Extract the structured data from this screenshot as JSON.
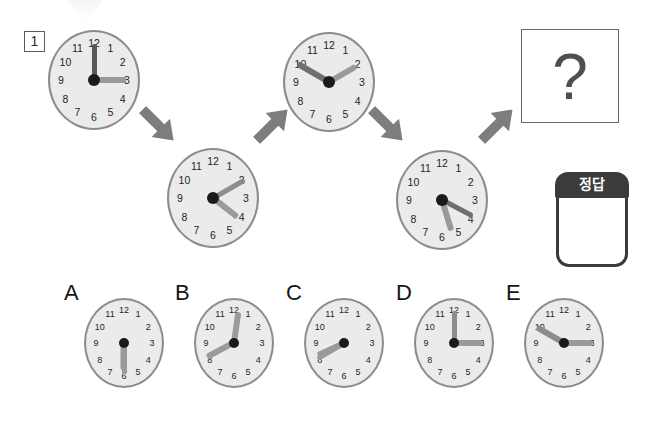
{
  "page": {
    "problem_number": "1",
    "question_mark": "?",
    "background_color": "#ffffff"
  },
  "colors": {
    "face": "#ebebeb",
    "rim": "#8c8c8c",
    "numeral": "#1f1f1f",
    "hand_dark": "#595959",
    "hand_light": "#9a9a9a",
    "pin": "#1a1a1a",
    "arrow": "#7d7d7d",
    "answer_cap": "#3b3b3b",
    "question_border": "#6a6a6a"
  },
  "clock_numerals": [
    "12",
    "1",
    "2",
    "3",
    "4",
    "5",
    "6",
    "7",
    "8",
    "9",
    "10",
    "11"
  ],
  "sequence": {
    "label": "clock-sequence",
    "clocks": [
      {
        "name": "sequence-clock-1",
        "time_label": "3:00",
        "x": 48,
        "y": 30,
        "hands": [
          {
            "role": "minute",
            "angle": 0,
            "length": 36,
            "width": 5,
            "color": "#595959"
          },
          {
            "role": "hour",
            "angle": 90,
            "length": 32,
            "width": 6,
            "color": "#9a9a9a"
          }
        ]
      },
      {
        "name": "sequence-clock-2",
        "time_label": "4:10",
        "x": 167,
        "y": 148,
        "hands": [
          {
            "role": "minute",
            "angle": 60,
            "length": 36,
            "width": 5,
            "color": "#8d8d8d"
          },
          {
            "role": "hour",
            "angle": 128,
            "length": 31,
            "width": 6,
            "color": "#9a9a9a"
          }
        ]
      },
      {
        "name": "sequence-clock-3",
        "time_label": "2:50",
        "x": 283,
        "y": 32,
        "hands": [
          {
            "role": "minute",
            "angle": 300,
            "length": 36,
            "width": 5.5,
            "color": "#6f6f6f"
          },
          {
            "role": "hour",
            "angle": 60,
            "length": 31,
            "width": 6,
            "color": "#9a9a9a"
          }
        ]
      },
      {
        "name": "sequence-clock-4",
        "time_label": "5:20",
        "x": 396,
        "y": 150,
        "hands": [
          {
            "role": "minute",
            "angle": 118,
            "length": 34,
            "width": 5,
            "color": "#6f6f6f"
          },
          {
            "role": "hour",
            "angle": 163,
            "length": 32,
            "width": 6,
            "color": "#9a9a9a"
          }
        ]
      }
    ]
  },
  "arrows": [
    {
      "name": "arrow-down-right-1",
      "x": 136,
      "y": 112,
      "rotation": 45
    },
    {
      "name": "arrow-up-right-1",
      "x": 250,
      "y": 112,
      "rotation": -45
    },
    {
      "name": "arrow-down-right-2",
      "x": 365,
      "y": 112,
      "rotation": 45
    },
    {
      "name": "arrow-up-right-2",
      "x": 475,
      "y": 112,
      "rotation": -45
    }
  ],
  "answer_box": {
    "label": "정답"
  },
  "options": [
    {
      "letter": "A",
      "name": "option-clock-a",
      "letter_x": 64,
      "letter_y": 282,
      "x": 84,
      "y": 298,
      "time_label": "6:30",
      "hands": [
        {
          "role": "minute",
          "angle": 180,
          "length": 31,
          "width": 5,
          "color": "#9a9a9a"
        },
        {
          "role": "hour",
          "angle": 180,
          "length": 27,
          "width": 5.5,
          "color": "#9a9a9a"
        }
      ]
    },
    {
      "letter": "B",
      "name": "option-clock-b",
      "letter_x": 175,
      "letter_y": 282,
      "x": 194,
      "y": 298,
      "time_label": "8:00",
      "hands": [
        {
          "role": "minute",
          "angle": 8,
          "length": 31,
          "width": 5.5,
          "color": "#9a9a9a"
        },
        {
          "role": "hour",
          "angle": 242,
          "length": 30,
          "width": 5.5,
          "color": "#9a9a9a"
        }
      ]
    },
    {
      "letter": "C",
      "name": "option-clock-c",
      "letter_x": 286,
      "letter_y": 282,
      "x": 304,
      "y": 298,
      "time_label": "8:40",
      "hands": [
        {
          "role": "minute",
          "angle": 240,
          "length": 31,
          "width": 5,
          "color": "#9a9a9a"
        },
        {
          "role": "hour",
          "angle": 245,
          "length": 29,
          "width": 6,
          "color": "#9a9a9a"
        }
      ]
    },
    {
      "letter": "D",
      "name": "option-clock-d",
      "letter_x": 396,
      "letter_y": 282,
      "x": 414,
      "y": 298,
      "time_label": "3:00",
      "hands": [
        {
          "role": "minute",
          "angle": 0,
          "length": 32,
          "width": 5,
          "color": "#8d8d8d"
        },
        {
          "role": "hour",
          "angle": 90,
          "length": 28,
          "width": 6,
          "color": "#9a9a9a"
        }
      ]
    },
    {
      "letter": "E",
      "name": "option-clock-e",
      "letter_x": 506,
      "letter_y": 282,
      "x": 524,
      "y": 298,
      "time_label": "2:50",
      "hands": [
        {
          "role": "minute",
          "angle": 300,
          "length": 31,
          "width": 5.5,
          "color": "#8d8d8d"
        },
        {
          "role": "hour",
          "angle": 90,
          "length": 28,
          "width": 6,
          "color": "#9a9a9a"
        }
      ]
    }
  ]
}
